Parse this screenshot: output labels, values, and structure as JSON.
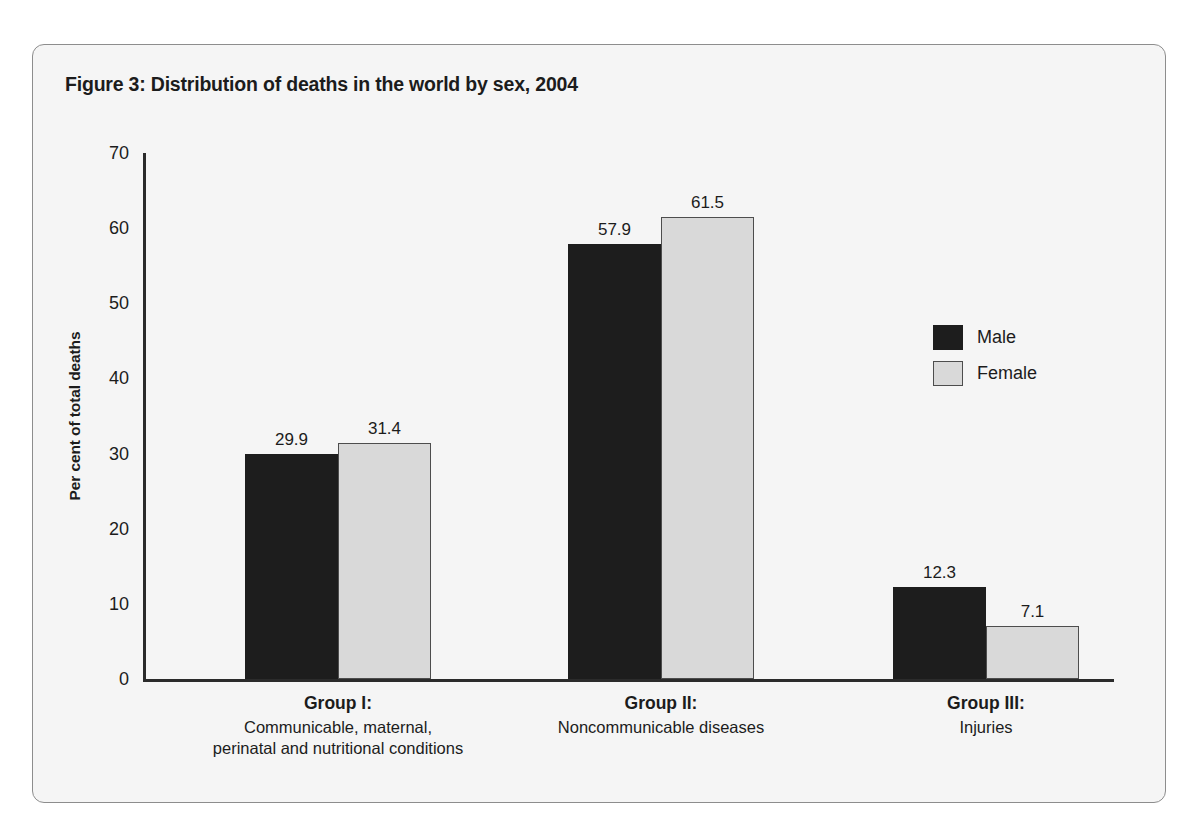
{
  "figure": {
    "title": "Figure 3: Distribution of deaths in the world by sex, 2004"
  },
  "chart_data": {
    "type": "bar",
    "title": "Figure 3: Distribution of deaths in the world by sex, 2004",
    "xlabel": "",
    "ylabel": "Per cent of  total deaths",
    "ylim": [
      0,
      70
    ],
    "yticks": [
      "0",
      "10",
      "20",
      "30",
      "40",
      "50",
      "60",
      "70"
    ],
    "grid": false,
    "legend_position": "right-middle",
    "categories": [
      {
        "title": "Group I:",
        "sublines": [
          "Communicable, maternal,",
          "perinatal and nutritional conditions"
        ]
      },
      {
        "title": "Group II:",
        "sublines": [
          "Noncommunicable diseases"
        ]
      },
      {
        "title": "Group III:",
        "sublines": [
          "Injuries"
        ]
      }
    ],
    "series": [
      {
        "name": "Male",
        "color": "#1d1d1d",
        "values": [
          29.9,
          57.9,
          12.3
        ],
        "labels": [
          "29.9",
          "57.9",
          "12.3"
        ]
      },
      {
        "name": "Female",
        "color": "#d9d9d9",
        "values": [
          31.4,
          61.5,
          7.1
        ],
        "labels": [
          "31.4",
          "61.5",
          "7.1"
        ]
      }
    ]
  },
  "legend": {
    "items": [
      {
        "label": "Male"
      },
      {
        "label": "Female"
      }
    ]
  }
}
